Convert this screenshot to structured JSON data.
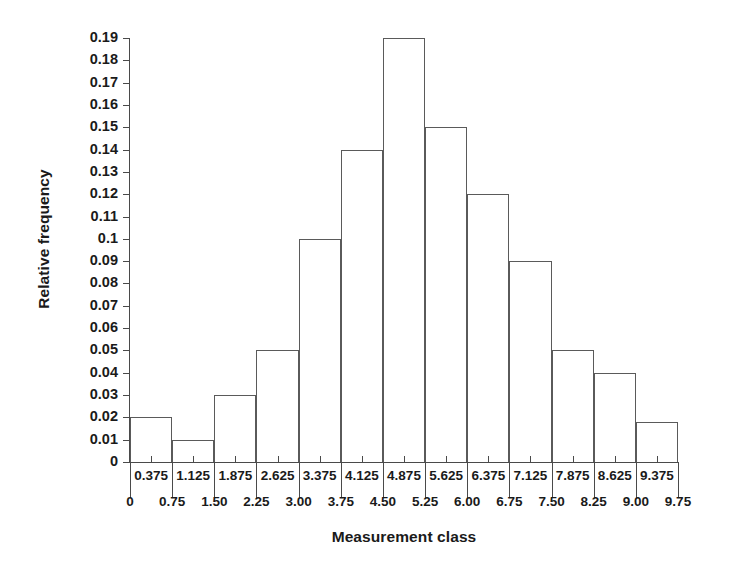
{
  "chart_data": {
    "type": "bar",
    "title": "",
    "xlabel": "Measurement class",
    "ylabel": "Relative frequency",
    "categories": [
      "0.375",
      "1.125",
      "1.875",
      "2.625",
      "3.375",
      "4.125",
      "4.875",
      "5.625",
      "6.375",
      "7.125",
      "7.875",
      "8.625",
      "9.375"
    ],
    "values": [
      0.02,
      0.01,
      0.03,
      0.05,
      0.1,
      0.14,
      0.19,
      0.15,
      0.12,
      0.09,
      0.05,
      0.04,
      0.018
    ],
    "bin_edges": [
      "0",
      "0.75",
      "1.50",
      "2.25",
      "3.00",
      "3.75",
      "4.50",
      "5.25",
      "6.00",
      "6.75",
      "7.50",
      "8.25",
      "9.00",
      "9.75"
    ],
    "bin_edge_values": [
      0,
      0.75,
      1.5,
      2.25,
      3.0,
      3.75,
      4.5,
      5.25,
      6.0,
      6.75,
      7.5,
      8.25,
      9.0,
      9.75
    ],
    "bin_width": 0.75,
    "xlim": [
      0,
      9.75
    ],
    "ylim": [
      0,
      0.19
    ],
    "ytick_labels": [
      "0",
      "0.01",
      "0.02",
      "0.03",
      "0.04",
      "0.05",
      "0.06",
      "0.07",
      "0.08",
      "0.09",
      "0.1",
      "0.11",
      "0.12",
      "0.13",
      "0.14",
      "0.15",
      "0.16",
      "0.17",
      "0.18",
      "0.19"
    ],
    "ytick_values": [
      0,
      0.01,
      0.02,
      0.03,
      0.04,
      0.05,
      0.06,
      0.07,
      0.08,
      0.09,
      0.1,
      0.11,
      0.12,
      0.13,
      0.14,
      0.15,
      0.16,
      0.17,
      0.18,
      0.19
    ],
    "grid": false,
    "legend": null,
    "bar_fill": "none",
    "bar_edge_color": "#5a5a5a",
    "axis_color": "#4a4a4a",
    "background": "#ffffff"
  }
}
